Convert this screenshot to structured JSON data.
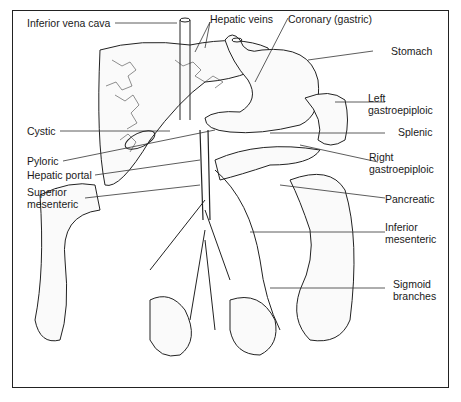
{
  "diagram": {
    "labels": {
      "inferior_vena_cava": "Inferior vena cava",
      "hepatic_veins": "Hepatic veins",
      "coronary_gastric": "Coronary (gastric)",
      "stomach": "Stomach",
      "left_gastroepiploic_1": "Left",
      "left_gastroepiploic_2": "gastroepiploic",
      "cystic": "Cystic",
      "splenic": "Splenic",
      "pyloric": "Pyloric",
      "right_gastroepiploic_1": "Right",
      "right_gastroepiploic_2": "gastroepiploic",
      "hepatic_portal": "Hepatic portal",
      "superior_mesenteric_1": "Superior",
      "superior_mesenteric_2": "mesenteric",
      "pancreatic": "Pancreatic",
      "inferior_mesenteric_1": "Inferior",
      "inferior_mesenteric_2": "mesenteric",
      "sigmoid_1": "Sigmoid",
      "sigmoid_2": "branches"
    }
  }
}
